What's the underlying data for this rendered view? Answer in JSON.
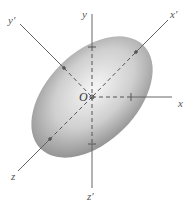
{
  "diagram": {
    "type": "rotated-axes-ellipsoid",
    "origin": {
      "label": "O",
      "x": 92,
      "y": 97
    },
    "ellipse": {
      "cx": 92,
      "cy": 97,
      "rx": 72,
      "ry": 44,
      "rotation_deg": -45
    },
    "axes": [
      {
        "name": "y",
        "label": "y"
      },
      {
        "name": "x",
        "label": "x"
      },
      {
        "name": "z",
        "label": "z"
      },
      {
        "name": "z-prime",
        "label": "z′"
      },
      {
        "name": "y-prime",
        "label": "y′"
      },
      {
        "name": "x-prime",
        "label": "x′"
      }
    ],
    "colors": {
      "axis": "#666666",
      "shade_dark": "#8a8a8a",
      "shade_light": "#f4f4f4"
    }
  }
}
